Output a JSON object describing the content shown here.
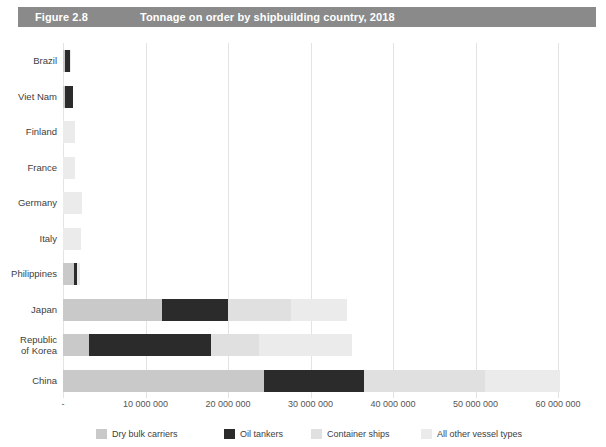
{
  "header": {
    "figure_number": "Figure 2.8",
    "title": "Tonnage on order by shipbuilding country, 2018",
    "band_color": "#8a8a8a",
    "text_color": "#ffffff"
  },
  "chart_data": {
    "type": "bar",
    "orientation": "horizontal",
    "stacked": true,
    "title": "Tonnage on order by shipbuilding country, 2018",
    "xlabel": "",
    "ylabel": "",
    "xlim": [
      0,
      60000000
    ],
    "grid": true,
    "legend_position": "bottom",
    "xticks": [
      0,
      10000000,
      20000000,
      30000000,
      40000000,
      50000000,
      60000000
    ],
    "xtick_labels": [
      "-",
      "10 000 000",
      "20 000 000",
      "30 000 000",
      "40 000 000",
      "50 000 000",
      "60 000 000"
    ],
    "categories": [
      "Brazil",
      "Viet Nam",
      "Finland",
      "France",
      "Germany",
      "Italy",
      "Philippines",
      "Japan",
      "Republic of Korea",
      "China"
    ],
    "series": [
      {
        "name": "Dry bulk carriers",
        "color": "#c9c9c9",
        "values": [
          300000,
          200000,
          0,
          0,
          0,
          0,
          1300000,
          12000000,
          3200000,
          24400000
        ]
      },
      {
        "name": "Oil tankers",
        "color": "#2b2b2b",
        "values": [
          500000,
          1000000,
          0,
          0,
          0,
          0,
          400000,
          8000000,
          14800000,
          12100000
        ]
      },
      {
        "name": "Container ships",
        "color": "#e0e0e0",
        "values": [
          0,
          0,
          0,
          0,
          0,
          0,
          0,
          7600000,
          5800000,
          14600000
        ]
      },
      {
        "name": "All other vessel types",
        "color": "#ebebeb",
        "values": [
          200000,
          0,
          1400000,
          1500000,
          2300000,
          2200000,
          400000,
          6800000,
          11200000,
          9200000
        ]
      }
    ],
    "totals": [
      1000000,
      1200000,
      1400000,
      1500000,
      2300000,
      2200000,
      2100000,
      34400000,
      35000000,
      60300000
    ]
  },
  "legend": [
    {
      "label": "Dry bulk carriers",
      "color": "#c9c9c9"
    },
    {
      "label": "Oil tankers",
      "color": "#2b2b2b"
    },
    {
      "label": "Container ships",
      "color": "#e0e0e0"
    },
    {
      "label": "All other vessel types",
      "color": "#ebebeb"
    }
  ]
}
